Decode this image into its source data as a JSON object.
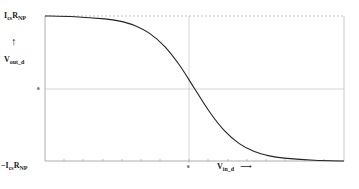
{
  "chart_data": {
    "type": "line",
    "title": "",
    "xlabel": "V_in_d",
    "ylabel": "V_out_d",
    "x_arrow": "→",
    "y_arrow": "↑",
    "y_top_label": {
      "main": "I",
      "sub1": "cs",
      "main2": "R",
      "sub2": "NP"
    },
    "y_bottom_label": {
      "prefix": "−",
      "main": "I",
      "sub1": "cs",
      "main2": "R",
      "sub2": "NP"
    },
    "y_zero_label": "0",
    "x_zero_label": "0",
    "xlim": [
      -5,
      5
    ],
    "ylim": [
      -1,
      1
    ],
    "y_ticks": [
      "-IcsRNP",
      "0",
      "IcsRNP"
    ],
    "x_ticks": [
      "0"
    ],
    "grid": {
      "center_lines": true,
      "top_dashed_reference": true
    },
    "legend": null,
    "series": [
      {
        "name": "V_out_d",
        "description": "decreasing tanh-shaped transfer curve",
        "x": [
          -5,
          -4,
          -3,
          -2.5,
          -2,
          -1.5,
          -1,
          -0.5,
          0,
          0.5,
          1,
          1.5,
          2,
          2.5,
          3,
          4,
          5
        ],
        "y": [
          1.0,
          0.99,
          0.96,
          0.93,
          0.87,
          0.76,
          0.58,
          0.32,
          0.0,
          -0.32,
          -0.58,
          -0.76,
          -0.87,
          -0.93,
          -0.96,
          -0.99,
          -1.0
        ]
      }
    ],
    "colors": {
      "curve": "#222222",
      "axes": "#999999",
      "grid": "#bbbbbb",
      "reference": "#aaaaaa"
    }
  },
  "labels": {
    "y_top": {
      "I": "I",
      "cs": "cs",
      "R": "R",
      "NP": "NP"
    },
    "y_bottom": {
      "minus": "−",
      "I": "I",
      "cs": "cs",
      "R": "R",
      "NP": "NP"
    },
    "y_axis_title": {
      "main": "V",
      "sub": "out_d"
    },
    "x_axis_title": {
      "main": "V",
      "sub": "in_d"
    },
    "y_arrow": "↑",
    "x_arrow": "⟶",
    "y_zero": "0",
    "x_zero": "0"
  }
}
